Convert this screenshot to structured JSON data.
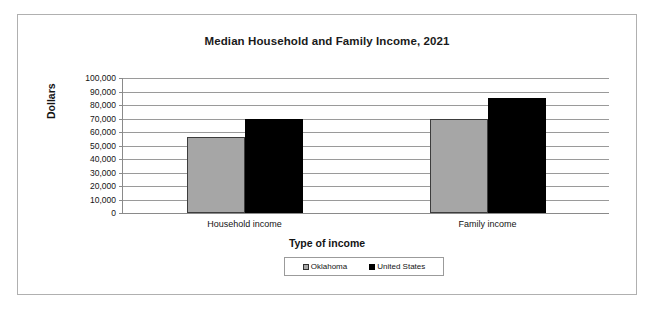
{
  "chart_data": {
    "type": "bar",
    "title": "Median Household and Family Income, 2021",
    "xlabel": "Type of income",
    "ylabel": "Dollars",
    "categories": [
      "Household income",
      "Family income"
    ],
    "series": [
      {
        "name": "Oklahoma",
        "color": "#a6a6a6",
        "values": [
          56000,
          70000
        ]
      },
      {
        "name": "United States",
        "color": "#000000",
        "values": [
          70000,
          85000
        ]
      }
    ],
    "ylim": [
      0,
      100000
    ],
    "ytick_labels": [
      "100,000",
      "90,000",
      "80,000",
      "70,000",
      "60,000",
      "50,000",
      "40,000",
      "30,000",
      "20,000",
      "10,000",
      "0"
    ],
    "ytick_values": [
      100000,
      90000,
      80000,
      70000,
      60000,
      50000,
      40000,
      30000,
      20000,
      10000,
      0
    ],
    "grid": true,
    "legend_position": "bottom-center"
  }
}
